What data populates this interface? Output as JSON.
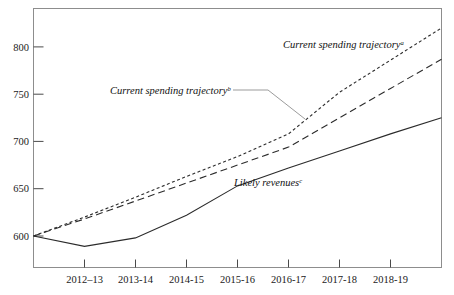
{
  "chart_data": {
    "type": "line",
    "title": "",
    "subtitle": "",
    "xlabel": "",
    "ylabel": "",
    "grid": false,
    "legend_position": "inline-annotations",
    "categories": [
      "2011-12",
      "2012-13",
      "2013-14",
      "2014-15",
      "2015-16",
      "2016-17",
      "2017-18",
      "2018-19",
      "2019-20"
    ],
    "x_tick_labels": [
      "2012–13",
      "2013-14",
      "2014-15",
      "2015-16",
      "2016-17",
      "2017-18",
      "2018-19"
    ],
    "y_tick_labels": [
      "600",
      "650",
      "700",
      "750",
      "800"
    ],
    "y_tick_values": [
      600,
      650,
      700,
      750,
      800
    ],
    "ylim": [
      563,
      828
    ],
    "xlim": [
      0,
      8
    ],
    "series": [
      {
        "name": "Current spending trajectory a",
        "style": "dotted",
        "values": [
          600,
          620,
          641,
          663,
          684,
          708,
          752,
          786,
          820
        ]
      },
      {
        "name": "Current spending trajectory b",
        "style": "dashed",
        "values": [
          600,
          618,
          637,
          656,
          675,
          694,
          725,
          756,
          787
        ]
      },
      {
        "name": "Likely revenues c",
        "style": "solid",
        "values": [
          600,
          589,
          598,
          622,
          653,
          672,
          690,
          708,
          725
        ]
      }
    ],
    "annotations": [
      {
        "id": "ann-dotted",
        "text": "Current spending trajectory",
        "superscript": "a",
        "x": 283,
        "y": 48
      },
      {
        "id": "ann-dashed",
        "text": "Current spending trajectory",
        "superscript": "b",
        "x": 110,
        "y": 94
      },
      {
        "id": "ann-solid",
        "text": "Likely revenues",
        "superscript": "c",
        "x": 234,
        "y": 186
      }
    ],
    "colors": {
      "line": "#2b2b2b",
      "frame": "#8d8d8d",
      "text": "#111111",
      "leader": "#909090",
      "background": "#ffffff"
    }
  }
}
